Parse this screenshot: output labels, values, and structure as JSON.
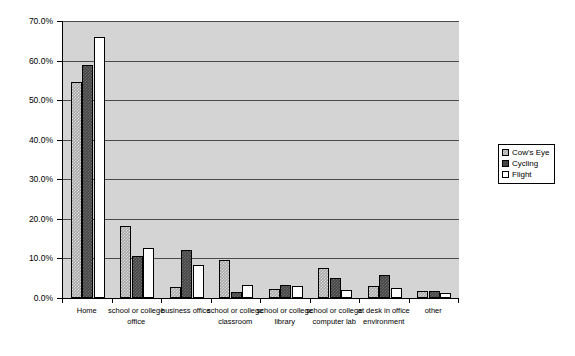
{
  "chart_data": {
    "type": "bar",
    "title": "",
    "subtitle": "",
    "xlabel": "",
    "ylabel": "",
    "ylim": [
      0,
      70
    ],
    "ytick_labels": [
      "0.0%",
      "10.0%",
      "20.0%",
      "30.0%",
      "40.0%",
      "50.0%",
      "60.0%",
      "70.0%"
    ],
    "ytick_values": [
      0,
      10,
      20,
      30,
      40,
      50,
      60,
      70
    ],
    "grid": true,
    "legend_position": "right",
    "categories": [
      "Home",
      "school or college office",
      "business office",
      "school or college classroom",
      "school or college library",
      "school or college computer lab",
      "at desk in office environment",
      "other"
    ],
    "series": [
      {
        "name": "Cow's Eye",
        "color": "#a8a8a8",
        "values": [
          54.5,
          18.3,
          2.7,
          9.5,
          2.3,
          7.5,
          3.0,
          1.7
        ]
      },
      {
        "name": "Cycling",
        "color": "#454545",
        "values": [
          59.0,
          10.5,
          12.2,
          1.5,
          3.2,
          5.0,
          5.8,
          1.8
        ]
      },
      {
        "name": "Flight",
        "color": "#ffffff",
        "values": [
          66.0,
          12.7,
          8.3,
          3.4,
          3.0,
          2.0,
          2.5,
          1.3
        ]
      }
    ]
  },
  "legend": {
    "items": [
      {
        "label": "Cow's Eye"
      },
      {
        "label": "Cycling"
      },
      {
        "label": "Flight"
      }
    ]
  }
}
